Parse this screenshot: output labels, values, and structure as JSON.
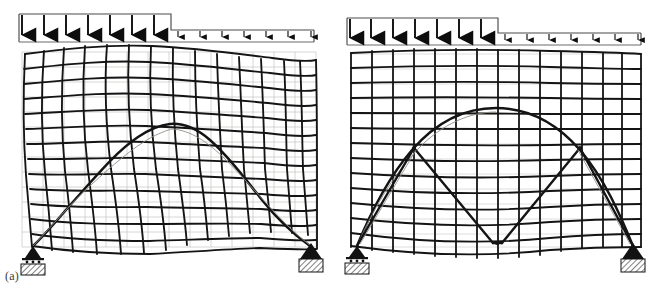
{
  "figure": {
    "caption_a": "(a)",
    "caption_b": "(b)",
    "background_color": "#ffffff",
    "ink_color": "#141414",
    "undeformed_grid_color": "#b9b9b4",
    "deformed_mesh_color": "#141414"
  },
  "panels": [
    {
      "id": "a",
      "label": "(a)",
      "description": "Deformed finite-element mesh of masonry panel with thrust line, flexible response",
      "mesh": {
        "columns": 14,
        "rows": 13,
        "deformed": true,
        "sway": "S-shaped lateral sway, crest right of centre"
      },
      "thrust_line": {
        "type": "asymmetric-arch",
        "peak_x_fraction": 0.42,
        "springing_left": "left support",
        "springing_right": "right support"
      },
      "supports": {
        "left": "roller-support",
        "right": "pinned-support"
      },
      "load": {
        "type": "stepped-distributed",
        "heavy_arrows": 7,
        "light_arrows": 7,
        "heavy_label": "",
        "light_label": ""
      }
    },
    {
      "id": "b",
      "label": "(b)",
      "description": "Stiff finite-element mesh with symmetric arch and V-shaped strut mechanism",
      "mesh": {
        "columns": 14,
        "rows": 13,
        "deformed": false,
        "sway": "negligible, near-rectilinear"
      },
      "thrust_line": {
        "type": "symmetric-arch",
        "peak_x_fraction": 0.5,
        "springing_left": "left support",
        "springing_right": "right support"
      },
      "strut_mechanism": {
        "type": "zigzag-V",
        "apex_left_x_fraction": 0.26,
        "valley_centre_x_fraction": 0.5,
        "apex_right_x_fraction": 0.76
      },
      "supports": {
        "left": "roller-support",
        "right": "pinned-support"
      },
      "load": {
        "type": "stepped-distributed",
        "heavy_arrows": 7,
        "light_arrows": 7
      }
    }
  ],
  "load_diagram": {
    "heavy_segment_label": "",
    "light_segment_label": "",
    "arrow_direction": "down"
  }
}
